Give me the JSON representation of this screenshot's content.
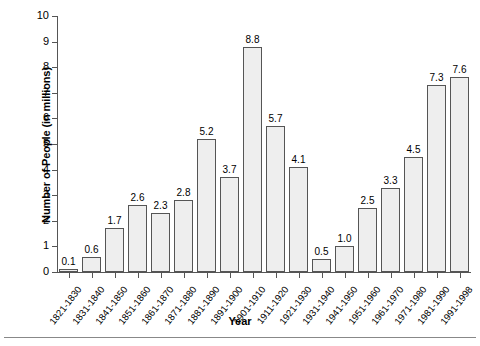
{
  "chart_data": {
    "type": "bar",
    "title": "",
    "xlabel": "Year",
    "ylabel": "Number of People (in millions)",
    "ylim": [
      0,
      10
    ],
    "ytick_labels": [
      "10",
      "9",
      "8",
      "7",
      "6",
      "5",
      "4",
      "3",
      "2",
      "1",
      "0"
    ],
    "yticks": [
      10,
      9,
      8,
      7,
      6,
      5,
      4,
      3,
      2,
      1,
      0
    ],
    "grid": false,
    "legend": null,
    "bar_color": "#eeeeee",
    "bar_edge_color": "#555555",
    "categories": [
      "1821-1830",
      "1831-1840",
      "1841-1850",
      "1851-1860",
      "1861-1870",
      "1871-1880",
      "1881-1890",
      "1891-1900",
      "1901-1910",
      "1911-1920",
      "1921-1930",
      "1931-1940",
      "1941-1950",
      "1951-1960",
      "1961-1970",
      "1971-1980",
      "1981-1990",
      "1991-1998"
    ],
    "values": [
      0.1,
      0.6,
      1.7,
      2.6,
      2.3,
      2.8,
      5.2,
      3.7,
      8.8,
      5.7,
      4.1,
      0.5,
      1.0,
      2.5,
      3.3,
      4.5,
      7.3,
      7.6
    ],
    "value_labels": [
      "0.1",
      "0.6",
      "1.7",
      "2.6",
      "2.3",
      "2.8",
      "5.2",
      "3.7",
      "8.8",
      "5.7",
      "4.1",
      "0.5",
      "1.0",
      "2.5",
      "3.3",
      "4.5",
      "7.3",
      "7.6"
    ]
  }
}
